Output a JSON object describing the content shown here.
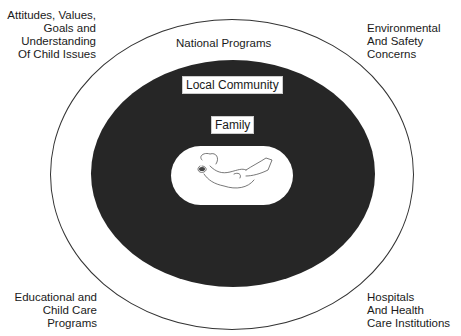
{
  "diagram": {
    "type": "nested-concentric-ecological-model",
    "layers": [
      {
        "id": "outer",
        "label": "National Programs"
      },
      {
        "id": "middle",
        "label": "Local Community"
      },
      {
        "id": "inner",
        "label": "Family"
      },
      {
        "id": "center",
        "label": "",
        "content": "infant-illustration"
      }
    ],
    "corner_labels": {
      "top_left": [
        "Attitudes, Values,",
        "Goals and",
        "Understanding",
        "Of Child Issues"
      ],
      "top_right": [
        "Environmental",
        "And Safety",
        "Concerns"
      ],
      "bottom_left": [
        "Educational and",
        "Child Care",
        "Programs"
      ],
      "bottom_right": [
        "Hospitals",
        "And Health",
        "Care Institutions"
      ]
    },
    "colors": {
      "background": "#ffffff",
      "dark_zone": "#262626",
      "outline": "#333333"
    }
  }
}
